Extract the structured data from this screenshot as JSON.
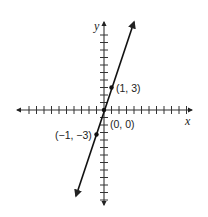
{
  "chart_data": {
    "type": "line",
    "title": "",
    "xlabel": "x",
    "ylabel": "y",
    "xlim": [
      -12,
      12
    ],
    "ylim": [
      -12,
      12
    ],
    "grid": false,
    "tick_spacing": 1,
    "series": [
      {
        "name": "y = 3x",
        "slope": 3,
        "intercept": 0,
        "x": [
          -1,
          0,
          1
        ],
        "y": [
          -3,
          0,
          3
        ]
      }
    ],
    "points": [
      {
        "x": 1,
        "y": 3,
        "label": "(1, 3)"
      },
      {
        "x": 0,
        "y": 0,
        "label": "(0, 0)"
      },
      {
        "x": -1,
        "y": -3,
        "label": "(−1, −3)"
      }
    ],
    "annotations": [
      "(1, 3)",
      "(0, 0)",
      "(−1, −3)"
    ]
  },
  "labels": {
    "x_axis": "x",
    "y_axis": "y",
    "p1": "(1, 3)",
    "origin": "(0, 0)",
    "p2": "(−1, −3)"
  },
  "colors": {
    "axis": "#222222",
    "line": "#111111",
    "background": "#ffffff"
  }
}
